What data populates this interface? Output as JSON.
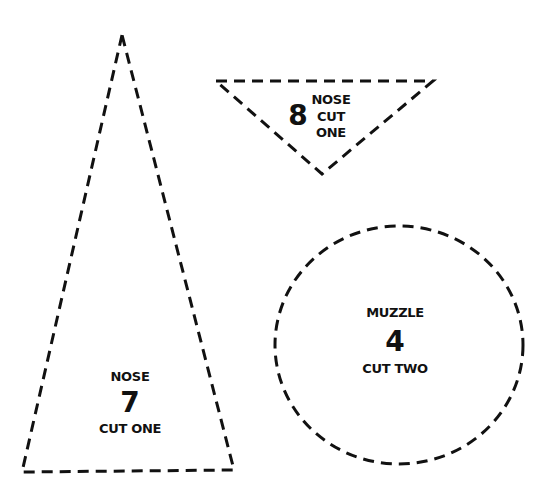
{
  "pieces": [
    {
      "id": "piece-7",
      "shape": "triangle",
      "part": "NOSE",
      "number": "7",
      "instruction": "CUT ONE"
    },
    {
      "id": "piece-8",
      "shape": "inverted-triangle",
      "part": "NOSE",
      "number": "8",
      "instruction_line1": "CUT",
      "instruction_line2": "ONE"
    },
    {
      "id": "piece-4",
      "shape": "circle",
      "part": "MUZZLE",
      "number": "4",
      "instruction": "CUT TWO"
    }
  ],
  "colors": {
    "line": "#111111",
    "background": "#ffffff"
  }
}
